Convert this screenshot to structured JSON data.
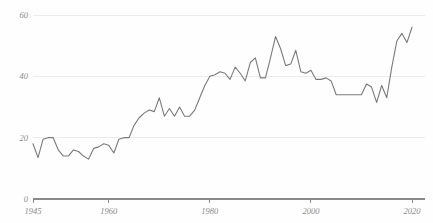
{
  "chart_data": {
    "type": "line",
    "title": "",
    "subtitle": "",
    "xlabel": "",
    "ylabel": "",
    "xlim": [
      1945,
      2020
    ],
    "ylim": [
      0,
      60
    ],
    "grid": true,
    "legend": "none",
    "x_ticks": [
      1945,
      1960,
      1980,
      2000,
      2020
    ],
    "x_tick_labels": [
      "1945",
      "1960",
      "1980",
      "2000",
      "2020"
    ],
    "y_ticks": [
      0,
      20,
      40,
      60
    ],
    "y_tick_labels": [
      "0",
      "20",
      "40",
      "60"
    ],
    "line_color": "#7a7a7a",
    "grid_color": "#ececec",
    "axis_color": "#8a8a8a",
    "background_color": "#fefefe",
    "series": [
      {
        "name": "series-1",
        "x": [
          1945,
          1946,
          1947,
          1948,
          1949,
          1950,
          1951,
          1952,
          1953,
          1954,
          1955,
          1956,
          1957,
          1958,
          1959,
          1960,
          1961,
          1962,
          1963,
          1964,
          1965,
          1966,
          1967,
          1968,
          1969,
          1970,
          1971,
          1972,
          1973,
          1974,
          1975,
          1976,
          1977,
          1978,
          1979,
          1980,
          1981,
          1982,
          1983,
          1984,
          1985,
          1986,
          1987,
          1988,
          1989,
          1990,
          1991,
          1992,
          1993,
          1994,
          1995,
          1996,
          1997,
          1998,
          1999,
          2000,
          2001,
          2002,
          2003,
          2004,
          2005,
          2006,
          2007,
          2008,
          2009,
          2010,
          2011,
          2012,
          2013,
          2014,
          2015,
          2016,
          2017,
          2018,
          2019,
          2020
        ],
        "values": [
          18.0,
          13.5,
          19.5,
          20.0,
          20.0,
          16.0,
          14.0,
          14.0,
          16.0,
          15.5,
          14.0,
          13.0,
          16.5,
          17.0,
          18.0,
          17.5,
          15.0,
          19.5,
          20.0,
          20.0,
          24.0,
          26.5,
          28.0,
          29.0,
          28.5,
          33.0,
          27.0,
          29.5,
          27.0,
          30.0,
          27.0,
          27.0,
          29.0,
          33.0,
          37.0,
          40.0,
          40.5,
          41.5,
          41.0,
          39.0,
          43.0,
          41.0,
          38.5,
          44.5,
          46.0,
          39.5,
          39.5,
          46.0,
          53.0,
          49.0,
          43.5,
          44.0,
          48.5,
          41.5,
          41.0,
          42.0,
          39.0,
          39.0,
          39.5,
          38.5,
          34.0,
          34.0,
          34.0,
          34.0,
          34.0,
          34.0,
          37.5,
          36.5,
          31.5,
          37.0,
          33.0,
          43.0,
          51.5,
          54.0,
          51.0,
          56.0
        ]
      }
    ]
  },
  "axis": {
    "y_axis_name": "value-axis",
    "x_axis_name": "year-axis"
  }
}
